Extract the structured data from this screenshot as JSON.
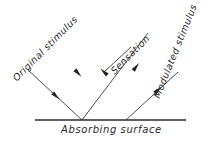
{
  "diagram": {
    "type": "optics-ray-reflection-diagram",
    "background_color": "#ffffff",
    "line_color": "#3a3a3a",
    "surface_color": "#2b2b2b",
    "text_color": "#2a2a2a",
    "labels": {
      "original_stimulus": "Original stimulus",
      "sensation": "Sensation",
      "modulated_stimulus": "Modulated stimulus",
      "absorbing_surface": "Absorbing surface"
    },
    "geometry": {
      "surface_line": {
        "x1": 35,
        "y1": 120,
        "x2": 186,
        "y2": 120
      },
      "incoming_ray": {
        "x1": 28,
        "y1": 70,
        "x2": 82,
        "y2": 120
      },
      "outgoing_ray": {
        "x1": 82,
        "y1": 120,
        "x2": 148,
        "y2": 33
      },
      "second_incoming_ray": {
        "x1": 126,
        "y1": 120,
        "x2": 178,
        "y2": 72
      },
      "sensation_arrow": {
        "x1": 131,
        "y1": 47,
        "x2": 103,
        "y2": 73
      },
      "crossing_point": {
        "x": 105,
        "y": 98
      },
      "vertex_left": {
        "x": 82,
        "y": 120
      },
      "vertex_right": {
        "x": 126,
        "y": 120
      }
    },
    "arrowheads": [
      {
        "name": "incoming-upper-arrow",
        "x": 56,
        "y": 96,
        "angle": 43
      },
      {
        "name": "incoming-lower-arrow",
        "x": 78,
        "y": 73,
        "angle": 47
      },
      {
        "name": "sensation-arrow-head",
        "x": 104,
        "y": 72,
        "angle": 223
      },
      {
        "name": "outgoing-mid-arrow",
        "x": 136,
        "y": 67,
        "angle": 307
      },
      {
        "name": "outgoing-right-arrow",
        "x": 158,
        "y": 90,
        "angle": 317
      }
    ]
  }
}
